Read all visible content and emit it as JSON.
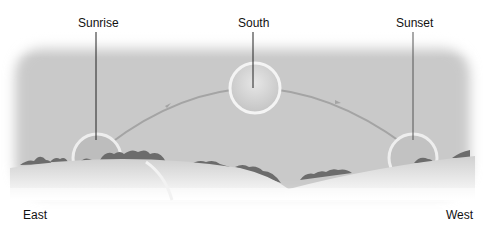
{
  "diagram": {
    "labels": {
      "sunrise": "Sunrise",
      "south": "South",
      "sunset": "Sunset",
      "east": "East",
      "west": "West"
    },
    "colors": {
      "sky": "#c8c8c8",
      "ground": "#d9d9d9",
      "trees": "#6a6a6a",
      "path": "#a0a0a0",
      "leader_line": "#222222"
    }
  }
}
